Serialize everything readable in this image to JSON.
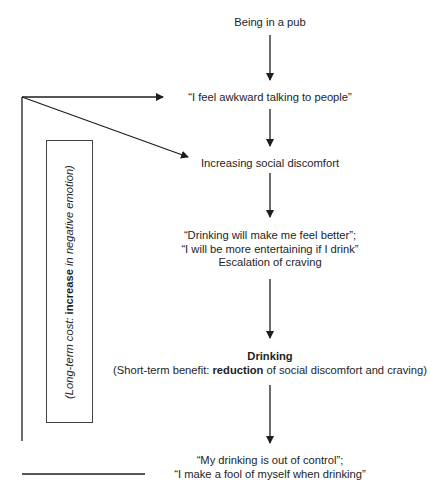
{
  "diagram": {
    "type": "flowchart",
    "nodes": [
      {
        "id": "pub",
        "lines": [
          "Being in a pub"
        ]
      },
      {
        "id": "awkward",
        "lines": [
          "“I feel awkward talking to people”"
        ]
      },
      {
        "id": "discomfort",
        "lines": [
          "Increasing social discomfort"
        ]
      },
      {
        "id": "craving",
        "lines": [
          "“Drinking will make me feel better”;",
          "“I will be more entertaining if I drink”",
          "Escalation of craving"
        ]
      },
      {
        "id": "drinking",
        "title": "Drinking",
        "subtitle_prefix": "(Short-term benefit: ",
        "subtitle_bold": "reduction",
        "subtitle_suffix": " of social discomfort and craving)"
      },
      {
        "id": "outcome",
        "lines": [
          "“My drinking is out of control”;",
          "“I make a fool of myself when drinking”"
        ]
      }
    ],
    "side_box": {
      "prefix": "(Long-term cost: ",
      "bold": "increase",
      "suffix": " in negative emotion)"
    },
    "edges": [
      {
        "from": "pub",
        "to": "awkward"
      },
      {
        "from": "awkward",
        "to": "discomfort"
      },
      {
        "from": "discomfort",
        "to": "craving"
      },
      {
        "from": "craving",
        "to": "drinking"
      },
      {
        "from": "drinking",
        "to": "outcome"
      },
      {
        "from": "outcome",
        "to": "awkward",
        "type": "feedback-loop"
      },
      {
        "from": "outcome",
        "to": "discomfort",
        "type": "feedback-loop"
      }
    ],
    "colors": {
      "line": "#1e1e1e",
      "text": "#1e1e1e",
      "box_border": "#444444"
    }
  }
}
